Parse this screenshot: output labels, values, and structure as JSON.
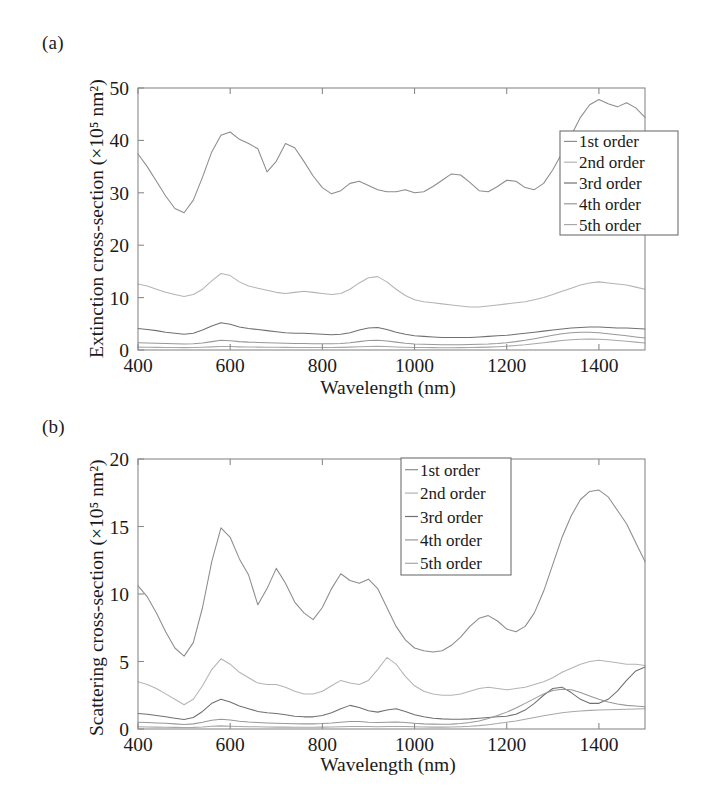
{
  "figure": {
    "panels": [
      {
        "id": "a",
        "label": "(a)",
        "ylabel": "Extinction cross-section (×10⁵ nm²)",
        "xlabel": "Wavelength (nm)"
      },
      {
        "id": "b",
        "label": "(b)",
        "ylabel": "Scattering cross-section (×10⁵ nm²)",
        "xlabel": "Wavelength (nm)"
      }
    ]
  },
  "legend": {
    "entries": [
      "1st order",
      "2nd order",
      "3rd order",
      "4th order",
      "5th order"
    ],
    "colors": [
      "#8c8c8c",
      "#b4b4b4",
      "#707070",
      "#989898",
      "#a8a8a8"
    ]
  },
  "chart_data": [
    {
      "type": "line",
      "panel": "a",
      "title": "",
      "xlabel": "Wavelength (nm)",
      "ylabel": "Extinction cross-section (×10^5 nm^2)",
      "xlim": [
        400,
        1500
      ],
      "ylim": [
        0,
        50
      ],
      "xticks": [
        400,
        600,
        800,
        1000,
        1200,
        1400
      ],
      "yticks": [
        0,
        10,
        20,
        30,
        40,
        50
      ],
      "grid": false,
      "legend_position": "right",
      "x": [
        400,
        420,
        440,
        460,
        480,
        500,
        520,
        540,
        560,
        580,
        600,
        620,
        640,
        660,
        680,
        700,
        720,
        740,
        760,
        780,
        800,
        820,
        840,
        860,
        880,
        900,
        920,
        940,
        960,
        980,
        1000,
        1020,
        1040,
        1060,
        1080,
        1100,
        1120,
        1140,
        1160,
        1180,
        1200,
        1220,
        1240,
        1260,
        1280,
        1300,
        1320,
        1340,
        1360,
        1380,
        1400,
        1420,
        1440,
        1460,
        1480,
        1500
      ],
      "series": [
        {
          "name": "1st order",
          "color": "#8c8c8c",
          "values": [
            37.4,
            35.0,
            32.2,
            29.4,
            27.0,
            26.2,
            28.6,
            33.0,
            37.8,
            41.0,
            41.6,
            40.2,
            39.4,
            38.4,
            34.0,
            36.0,
            39.4,
            38.6,
            36.0,
            33.2,
            31.0,
            29.8,
            30.4,
            31.8,
            32.2,
            31.4,
            30.6,
            30.2,
            30.2,
            30.6,
            30.0,
            30.2,
            31.2,
            32.4,
            33.6,
            33.4,
            32.0,
            30.4,
            30.2,
            31.2,
            32.4,
            32.2,
            31.0,
            30.6,
            31.8,
            34.4,
            37.6,
            41.0,
            44.4,
            46.8,
            47.8,
            47.0,
            46.4,
            47.2,
            46.2,
            44.4
          ]
        },
        {
          "name": "2nd order",
          "color": "#b4b4b4",
          "values": [
            12.6,
            12.2,
            11.6,
            11.0,
            10.6,
            10.2,
            10.6,
            11.6,
            13.2,
            14.6,
            14.2,
            13.0,
            12.2,
            11.8,
            11.4,
            11.0,
            10.8,
            11.0,
            11.2,
            11.0,
            10.8,
            10.6,
            10.8,
            11.6,
            12.8,
            13.8,
            14.0,
            13.0,
            11.6,
            10.4,
            9.6,
            9.2,
            9.0,
            8.8,
            8.6,
            8.4,
            8.2,
            8.2,
            8.4,
            8.6,
            8.8,
            9.0,
            9.2,
            9.6,
            10.0,
            10.6,
            11.2,
            11.8,
            12.4,
            12.8,
            13.0,
            12.8,
            12.6,
            12.4,
            12.0,
            11.6
          ]
        },
        {
          "name": "3rd order",
          "color": "#707070",
          "values": [
            4.1,
            3.9,
            3.7,
            3.4,
            3.2,
            3.0,
            3.2,
            3.8,
            4.6,
            5.2,
            4.9,
            4.4,
            4.1,
            3.9,
            3.7,
            3.5,
            3.3,
            3.2,
            3.2,
            3.1,
            3.0,
            2.9,
            3.0,
            3.3,
            3.8,
            4.2,
            4.3,
            3.9,
            3.4,
            3.0,
            2.7,
            2.6,
            2.5,
            2.4,
            2.4,
            2.4,
            2.4,
            2.5,
            2.6,
            2.7,
            2.8,
            3.0,
            3.2,
            3.4,
            3.6,
            3.8,
            4.0,
            4.2,
            4.3,
            4.4,
            4.4,
            4.3,
            4.2,
            4.2,
            4.1,
            4.0
          ]
        },
        {
          "name": "4th order",
          "color": "#989898",
          "values": [
            1.4,
            1.35,
            1.3,
            1.25,
            1.2,
            1.15,
            1.2,
            1.35,
            1.6,
            1.85,
            1.75,
            1.6,
            1.5,
            1.45,
            1.4,
            1.35,
            1.3,
            1.25,
            1.25,
            1.2,
            1.2,
            1.2,
            1.25,
            1.4,
            1.6,
            1.8,
            1.85,
            1.7,
            1.5,
            1.3,
            1.15,
            1.1,
            1.05,
            1.0,
            1.0,
            1.0,
            1.05,
            1.1,
            1.15,
            1.25,
            1.4,
            1.6,
            1.85,
            2.15,
            2.5,
            2.8,
            3.1,
            3.3,
            3.4,
            3.4,
            3.3,
            3.1,
            2.9,
            2.7,
            2.5,
            2.3
          ]
        },
        {
          "name": "5th order",
          "color": "#a8a8a8",
          "values": [
            0.55,
            0.53,
            0.5,
            0.48,
            0.46,
            0.45,
            0.47,
            0.52,
            0.6,
            0.68,
            0.65,
            0.6,
            0.57,
            0.55,
            0.53,
            0.52,
            0.5,
            0.49,
            0.49,
            0.48,
            0.48,
            0.48,
            0.5,
            0.55,
            0.62,
            0.68,
            0.7,
            0.65,
            0.58,
            0.52,
            0.48,
            0.46,
            0.45,
            0.44,
            0.44,
            0.45,
            0.47,
            0.5,
            0.55,
            0.62,
            0.72,
            0.85,
            1.0,
            1.2,
            1.4,
            1.6,
            1.8,
            1.95,
            2.05,
            2.1,
            2.05,
            1.95,
            1.8,
            1.65,
            1.5,
            1.35
          ]
        }
      ]
    },
    {
      "type": "line",
      "panel": "b",
      "title": "",
      "xlabel": "Wavelength (nm)",
      "ylabel": "Scattering cross-section (×10^5 nm^2)",
      "xlim": [
        400,
        1500
      ],
      "ylim": [
        0,
        20
      ],
      "xticks": [
        400,
        600,
        800,
        1000,
        1200,
        1400
      ],
      "yticks": [
        0,
        5,
        10,
        15,
        20
      ],
      "grid": false,
      "legend_position": "upper-center",
      "x": [
        400,
        420,
        440,
        460,
        480,
        500,
        520,
        540,
        560,
        580,
        600,
        620,
        640,
        660,
        680,
        700,
        720,
        740,
        760,
        780,
        800,
        820,
        840,
        860,
        880,
        900,
        920,
        940,
        960,
        980,
        1000,
        1020,
        1040,
        1060,
        1080,
        1100,
        1120,
        1140,
        1160,
        1180,
        1200,
        1220,
        1240,
        1260,
        1280,
        1300,
        1320,
        1340,
        1360,
        1380,
        1400,
        1420,
        1440,
        1460,
        1480,
        1500
      ],
      "series": [
        {
          "name": "1st order",
          "color": "#8c8c8c",
          "values": [
            10.6,
            9.8,
            8.6,
            7.2,
            6.0,
            5.4,
            6.4,
            9.0,
            12.4,
            14.9,
            14.2,
            12.6,
            11.4,
            9.2,
            10.4,
            11.9,
            10.8,
            9.4,
            8.6,
            8.1,
            9.0,
            10.4,
            11.5,
            11.0,
            10.8,
            11.1,
            10.4,
            9.0,
            7.6,
            6.6,
            6.0,
            5.8,
            5.7,
            5.8,
            6.2,
            6.8,
            7.6,
            8.2,
            8.4,
            8.0,
            7.4,
            7.2,
            7.6,
            8.6,
            10.2,
            12.2,
            14.2,
            15.8,
            17.0,
            17.6,
            17.7,
            17.2,
            16.2,
            15.2,
            13.8,
            12.4
          ]
        },
        {
          "name": "2nd order",
          "color": "#b4b4b4",
          "values": [
            3.5,
            3.3,
            3.0,
            2.6,
            2.2,
            1.8,
            2.2,
            3.2,
            4.4,
            5.2,
            4.8,
            4.2,
            3.8,
            3.4,
            3.3,
            3.3,
            3.1,
            2.8,
            2.6,
            2.6,
            2.8,
            3.2,
            3.6,
            3.4,
            3.3,
            3.6,
            4.4,
            5.3,
            4.8,
            3.9,
            3.2,
            2.8,
            2.6,
            2.5,
            2.5,
            2.6,
            2.8,
            3.0,
            3.1,
            3.0,
            2.9,
            3.0,
            3.1,
            3.3,
            3.5,
            3.8,
            4.2,
            4.5,
            4.8,
            5.0,
            5.1,
            5.0,
            4.9,
            4.8,
            4.8,
            4.7
          ]
        },
        {
          "name": "3rd order",
          "color": "#707070",
          "values": [
            1.15,
            1.1,
            1.0,
            0.9,
            0.8,
            0.7,
            0.85,
            1.3,
            1.9,
            2.2,
            2.0,
            1.7,
            1.5,
            1.3,
            1.2,
            1.15,
            1.05,
            0.95,
            0.9,
            0.9,
            1.0,
            1.2,
            1.5,
            1.75,
            1.6,
            1.35,
            1.25,
            1.4,
            1.5,
            1.3,
            1.05,
            0.9,
            0.8,
            0.75,
            0.72,
            0.72,
            0.75,
            0.8,
            0.85,
            0.9,
            0.95,
            1.1,
            1.4,
            1.9,
            2.5,
            3.0,
            3.1,
            2.7,
            2.2,
            1.9,
            1.9,
            2.2,
            2.8,
            3.6,
            4.3,
            4.6
          ]
        },
        {
          "name": "4th order",
          "color": "#989898",
          "values": [
            0.5,
            0.48,
            0.45,
            0.42,
            0.38,
            0.34,
            0.38,
            0.5,
            0.65,
            0.72,
            0.66,
            0.58,
            0.52,
            0.48,
            0.45,
            0.43,
            0.41,
            0.39,
            0.38,
            0.38,
            0.4,
            0.44,
            0.5,
            0.56,
            0.55,
            0.5,
            0.48,
            0.5,
            0.52,
            0.48,
            0.42,
            0.38,
            0.36,
            0.35,
            0.36,
            0.4,
            0.48,
            0.6,
            0.78,
            1.0,
            1.25,
            1.55,
            1.9,
            2.25,
            2.6,
            2.85,
            2.95,
            2.9,
            2.7,
            2.45,
            2.2,
            2.0,
            1.85,
            1.75,
            1.7,
            1.65
          ]
        },
        {
          "name": "5th order",
          "color": "#a8a8a8",
          "values": [
            0.16,
            0.15,
            0.14,
            0.13,
            0.12,
            0.11,
            0.12,
            0.15,
            0.2,
            0.23,
            0.21,
            0.19,
            0.17,
            0.16,
            0.15,
            0.14,
            0.14,
            0.13,
            0.13,
            0.13,
            0.14,
            0.15,
            0.17,
            0.19,
            0.19,
            0.18,
            0.17,
            0.18,
            0.19,
            0.18,
            0.16,
            0.15,
            0.14,
            0.14,
            0.15,
            0.17,
            0.2,
            0.25,
            0.32,
            0.4,
            0.5,
            0.6,
            0.72,
            0.85,
            0.98,
            1.1,
            1.2,
            1.28,
            1.34,
            1.38,
            1.4,
            1.42,
            1.44,
            1.46,
            1.48,
            1.5
          ]
        }
      ]
    }
  ]
}
